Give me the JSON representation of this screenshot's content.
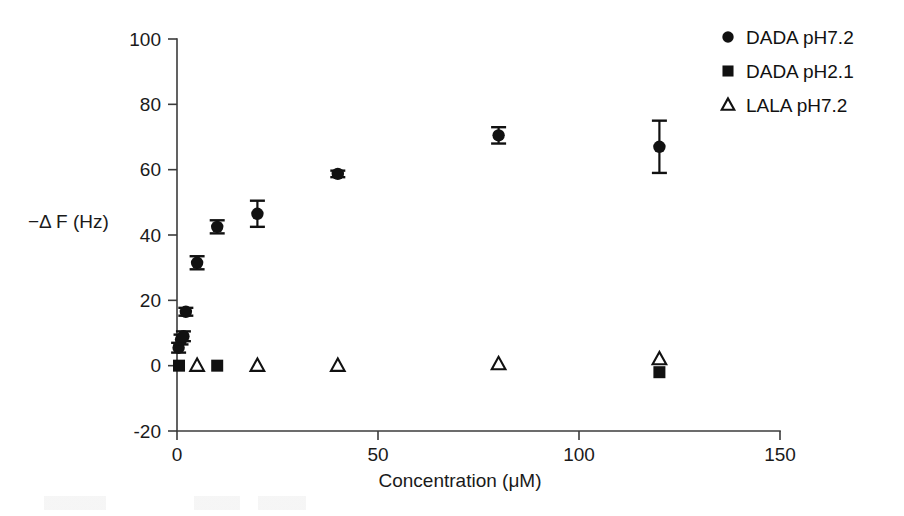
{
  "chart_data": {
    "type": "scatter",
    "title": "",
    "xlabel": "Concentration (μM)",
    "ylabel": "−Δ F (Hz)",
    "xlim": [
      0,
      150
    ],
    "ylim": [
      -20,
      100
    ],
    "xticks": [
      0,
      50,
      100,
      150
    ],
    "yticks": [
      -20,
      0,
      20,
      40,
      60,
      80,
      100
    ],
    "xtick_labels": [
      "0",
      "50",
      "100",
      "150"
    ],
    "ytick_labels": [
      "-20",
      "0",
      "20",
      "40",
      "60",
      "80",
      "100"
    ],
    "grid": false,
    "legend_position": "top-right",
    "series": [
      {
        "name": "DADA pH7.2",
        "marker": "filled-circle",
        "color": "#111111",
        "x": [
          0.4,
          1.0,
          1.6,
          2.2,
          5,
          10,
          20,
          40,
          80,
          120
        ],
        "y": [
          5.5,
          8.0,
          9.0,
          16.5,
          31.5,
          42.5,
          46.5,
          58.7,
          70.5,
          67.0
        ],
        "yerr": [
          1.5,
          1.5,
          1.5,
          1.2,
          2.0,
          2.0,
          4.0,
          1.0,
          2.5,
          8.0
        ]
      },
      {
        "name": "DADA pH2.1",
        "marker": "filled-square",
        "color": "#111111",
        "x": [
          0.5,
          10,
          120
        ],
        "y": [
          0.0,
          0.0,
          -2.0
        ],
        "yerr": [
          0.0,
          0.0,
          0.0
        ]
      },
      {
        "name": "LALA pH7.2",
        "marker": "open-triangle",
        "color": "#111111",
        "x": [
          5,
          20,
          40,
          80,
          120
        ],
        "y": [
          0.0,
          0.0,
          0.0,
          0.5,
          2.0
        ],
        "yerr": [
          0.0,
          0.0,
          0.0,
          0.0,
          0.0
        ]
      }
    ],
    "legend": [
      {
        "label": "DADA pH7.2",
        "marker": "filled-circle"
      },
      {
        "label": "DADA pH2.1",
        "marker": "filled-square"
      },
      {
        "label": "LALA pH7.2",
        "marker": "open-triangle"
      }
    ]
  }
}
